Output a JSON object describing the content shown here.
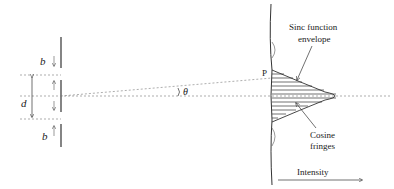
{
  "diagram": {
    "labels": {
      "b_top": "b",
      "b_bottom": "b",
      "d": "d",
      "theta": "θ",
      "point_p": "P",
      "sinc_line1": "Sinc function",
      "sinc_line2": "envelope",
      "cosine_line1": "Cosine",
      "cosine_line2": "fringes",
      "intensity": "Intensity"
    },
    "colors": {
      "line": "#333333",
      "dashed": "#777777",
      "text": "#222222"
    }
  }
}
